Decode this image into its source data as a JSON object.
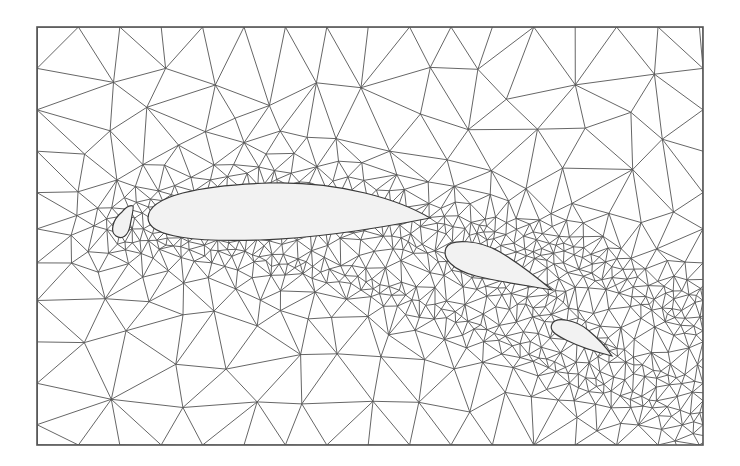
{
  "figure": {
    "frame": {
      "x": 37,
      "y": 27,
      "width": 666,
      "height": 418
    },
    "colors": {
      "background": "#ffffff",
      "edge": "#555555",
      "frame": "#555555",
      "body_fill": "#f2f2f2",
      "dense": "#3a3a3a"
    },
    "elements": [
      {
        "name": "slat",
        "path": "M122,212 C112,220 110,232 116,236 C122,240 128,236 130,226 C132,216 134,207 133,206 C130,205 126,207 122,212 Z"
      },
      {
        "name": "main-element",
        "path": "M148,218 C148,196 200,185 270,183 C340,181 400,200 430,218 C380,228 320,238 260,240 C200,242 148,238 148,218 Z"
      },
      {
        "name": "flap-1",
        "path": "M446,248 C450,238 480,240 500,252 C520,264 540,280 552,290 C530,286 500,282 476,276 C452,270 442,258 446,248 Z"
      },
      {
        "name": "flap-2",
        "path": "M552,324 C556,316 576,320 588,330 C600,340 608,350 612,356 C596,352 578,346 566,340 C554,334 549,330 552,324 Z"
      }
    ],
    "mesh": {
      "seed": 7,
      "coarse_spacing": 46,
      "fine_spacing": 7,
      "wake_angle_deg": 16
    }
  }
}
